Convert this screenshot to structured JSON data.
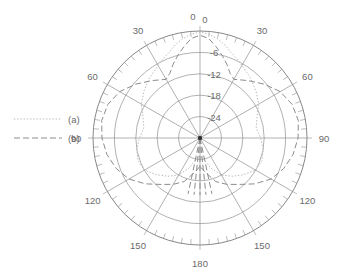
{
  "chart_data": {
    "type": "line",
    "subtype": "polar-radiation-pattern",
    "title": "",
    "xlabel": "",
    "ylabel": "",
    "grid": true,
    "legend_position": "left",
    "angular_axis": {
      "unit": "degrees",
      "zero_at": "top",
      "range": [
        -180,
        180
      ],
      "major_step": 30,
      "minor_step": 5,
      "tick_labels_left": [
        "0",
        "30",
        "60",
        "90",
        "120",
        "150",
        "180"
      ],
      "tick_labels_right": [
        "0",
        "30",
        "60",
        "90",
        "120",
        "150"
      ],
      "labels": [
        {
          "text": "0",
          "angle": 0,
          "side": "left"
        },
        {
          "text": "0",
          "angle": 0,
          "side": "right"
        },
        {
          "text": "30",
          "angle": 30,
          "side": "left"
        },
        {
          "text": "30",
          "angle": 30,
          "side": "right"
        },
        {
          "text": "60",
          "angle": 60,
          "side": "left"
        },
        {
          "text": "60",
          "angle": 60,
          "side": "right"
        },
        {
          "text": "90",
          "angle": 90,
          "side": "left"
        },
        {
          "text": "90",
          "angle": 90,
          "side": "right"
        },
        {
          "text": "120",
          "angle": 120,
          "side": "left"
        },
        {
          "text": "120",
          "angle": 120,
          "side": "right"
        },
        {
          "text": "150",
          "angle": 150,
          "side": "left"
        },
        {
          "text": "150",
          "angle": 150,
          "side": "right"
        },
        {
          "text": "180",
          "angle": 180,
          "side": "center"
        }
      ]
    },
    "radial_axis": {
      "unit": "dB",
      "rlim": [
        -30,
        0
      ],
      "outer_value": 0,
      "center_value": -30,
      "step": 6,
      "tick_labels": [
        "-6",
        "-12",
        "-18",
        "-24"
      ],
      "tick_values": [
        -6,
        -12,
        -18,
        -24
      ],
      "n_circles": 5
    },
    "series": [
      {
        "name": "(a)",
        "style": "dotted",
        "color": "#b9b9b9",
        "angles": [
          -180,
          -170,
          -160,
          -150,
          -140,
          -130,
          -120,
          -110,
          -100,
          -90,
          -80,
          -70,
          -60,
          -50,
          -40,
          -30,
          -25,
          -20,
          -15,
          -10,
          -5,
          0,
          5,
          10,
          15,
          20,
          25,
          30,
          40,
          50,
          60,
          70,
          80,
          90,
          100,
          110,
          120,
          130,
          140,
          150,
          160,
          170,
          180
        ],
        "values": [
          -25,
          -24,
          -21,
          -18,
          -16,
          -14,
          -12,
          -11.5,
          -12,
          -13,
          -14,
          -13,
          -11,
          -9.5,
          -8,
          -6.5,
          -5.5,
          -4.5,
          -3,
          -1.8,
          -0.8,
          -0.3,
          -0.8,
          -1.8,
          -3,
          -4.5,
          -5.5,
          -6.5,
          -8,
          -9.5,
          -11,
          -13,
          -14,
          -13,
          -12,
          -11.5,
          -12,
          -14,
          -16,
          -18,
          -21,
          -24,
          -25
        ]
      },
      {
        "name": "(b)",
        "style": "dash-dot",
        "color": "#8d8d8d",
        "angles": [
          -180,
          -170,
          -160,
          -150,
          -140,
          -130,
          -120,
          -110,
          -100,
          -90,
          -80,
          -70,
          -60,
          -50,
          -40,
          -30,
          -25,
          -20,
          -15,
          -10,
          -5,
          0,
          5,
          10,
          15,
          20,
          25,
          30,
          40,
          50,
          60,
          70,
          80,
          90,
          100,
          110,
          120,
          130,
          140,
          150,
          160,
          170,
          180
        ],
        "values": [
          -22,
          -20,
          -17,
          -15,
          -13,
          -10,
          -7,
          -5,
          -3.5,
          -2.5,
          -2,
          -2.5,
          -4,
          -6.5,
          -9,
          -11,
          -10,
          -8,
          -6,
          -4,
          -2,
          -1.2,
          -2,
          -4,
          -6,
          -8,
          -10,
          -11,
          -9,
          -6.5,
          -4,
          -2.5,
          -2,
          -2.5,
          -3.5,
          -5,
          -7,
          -10,
          -13,
          -15,
          -17,
          -20,
          -22
        ]
      }
    ]
  },
  "legend": {
    "entries": [
      {
        "label": "(a)",
        "style": "dotted"
      },
      {
        "label": "(b)",
        "style": "dash-dot"
      }
    ]
  }
}
